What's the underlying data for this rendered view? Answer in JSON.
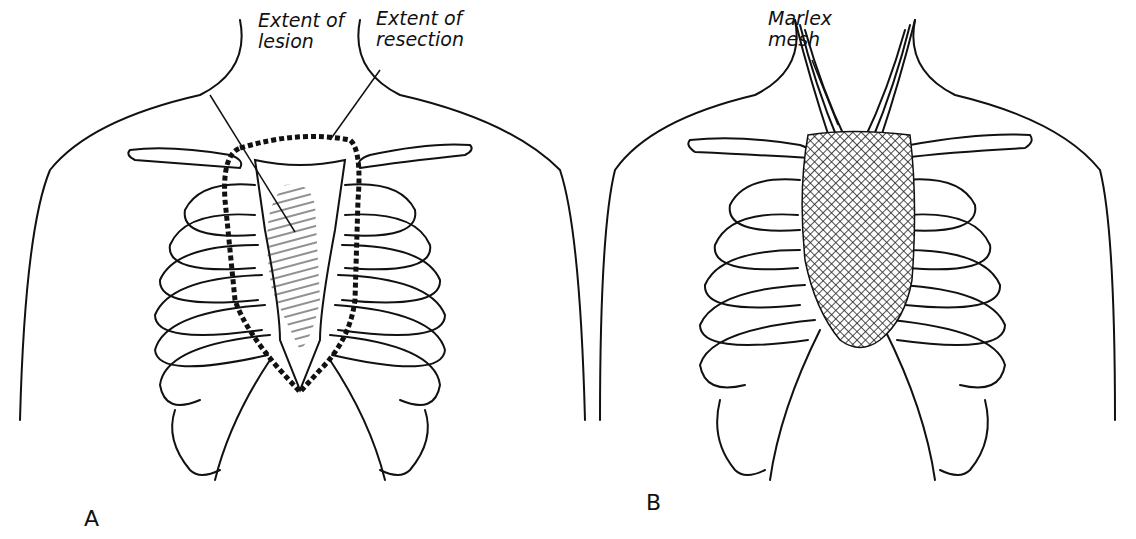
{
  "figure": {
    "panels": [
      {
        "letter": "A",
        "labels": {
          "lesion": "Extent of\nlesion",
          "resection": "Extent of\nresection"
        }
      },
      {
        "letter": "B",
        "labels": {
          "mesh": "Marlex\nmesh"
        }
      }
    ],
    "colors": {
      "line": "#111111",
      "background": "#ffffff"
    }
  }
}
